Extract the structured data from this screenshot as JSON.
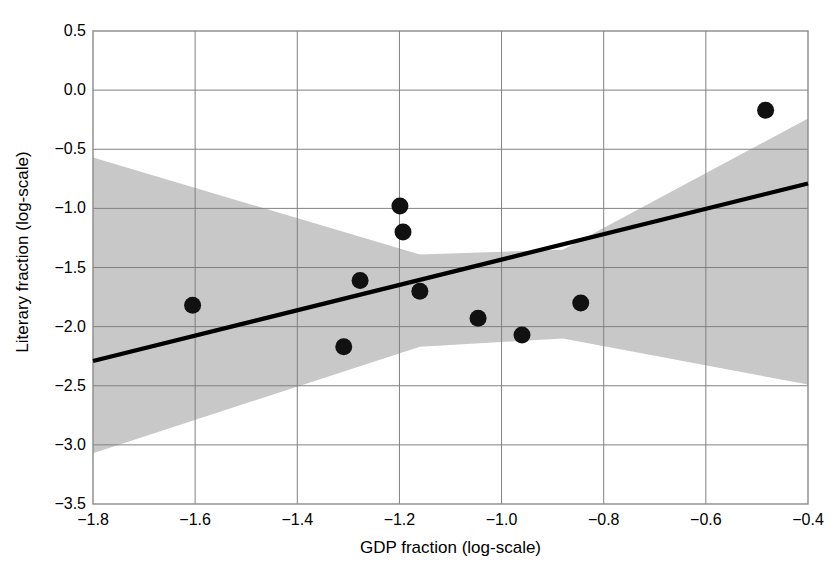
{
  "chart_data": {
    "type": "scatter",
    "title": "",
    "xlabel": "GDP fraction (log-scale)",
    "ylabel": "Literary fraction (log-scale)",
    "xlim": [
      -1.8,
      -0.4
    ],
    "ylim": [
      -3.5,
      0.5
    ],
    "xticks": [
      "-1.8",
      "-1.6",
      "-1.4",
      "-1.2",
      "-1.0",
      "-0.8",
      "-0.6",
      "-0.4"
    ],
    "xtick_values": [
      -1.8,
      -1.6,
      -1.4,
      -1.2,
      -1.0,
      -0.8,
      -0.6,
      -0.4
    ],
    "yticks": [
      "0.5",
      "0.0",
      "-0.5",
      "-1.0",
      "-1.5",
      "-2.0",
      "-2.5",
      "-3.0",
      "-3.5"
    ],
    "ytick_values": [
      0.5,
      0.0,
      -0.5,
      -1.0,
      -1.5,
      -2.0,
      -2.5,
      -3.0,
      -3.5
    ],
    "grid": true,
    "legend": "none",
    "points": [
      {
        "x": -1.605,
        "y": -1.82
      },
      {
        "x": -1.309,
        "y": -2.17
      },
      {
        "x": -1.277,
        "y": -1.61
      },
      {
        "x": -1.199,
        "y": -0.98
      },
      {
        "x": -1.193,
        "y": -1.2
      },
      {
        "x": -1.16,
        "y": -1.7
      },
      {
        "x": -1.046,
        "y": -1.93
      },
      {
        "x": -0.96,
        "y": -2.07
      },
      {
        "x": -0.845,
        "y": -1.8
      },
      {
        "x": -0.483,
        "y": -0.17
      }
    ],
    "series": [
      {
        "name": "regression line",
        "type": "line",
        "x": [
          -1.8,
          -0.4
        ],
        "values": [
          -2.29,
          -0.79
        ]
      },
      {
        "name": "confidence band upper",
        "type": "line",
        "x": [
          -1.8,
          -1.16,
          -0.88,
          -0.4
        ],
        "values": [
          -0.57,
          -1.39,
          -1.35,
          -0.24
        ]
      },
      {
        "name": "confidence band lower",
        "type": "line",
        "x": [
          -1.8,
          -1.16,
          -0.88,
          -0.4
        ],
        "values": [
          -3.07,
          -2.17,
          -2.1,
          -2.49
        ]
      }
    ],
    "colors": {
      "point": "#111111",
      "line": "#000000",
      "band": "#c8c8c8",
      "grid": "#808080",
      "axis": "#808080",
      "background": "#ffffff"
    }
  }
}
